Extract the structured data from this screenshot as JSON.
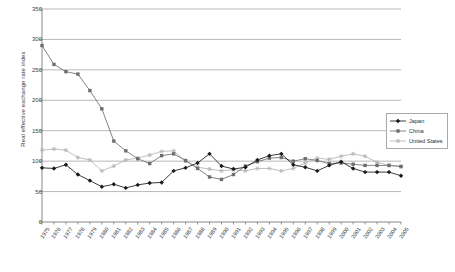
{
  "chart_data": {
    "type": "line",
    "title": "",
    "xlabel": "",
    "ylabel": "Real effective exchange rate index",
    "ylim": [
      0,
      350
    ],
    "yticks": [
      0,
      50,
      100,
      150,
      200,
      250,
      300,
      350
    ],
    "grid": "horizontal",
    "legend_position": "right",
    "categories": [
      "1975",
      "1976",
      "1977",
      "1978",
      "1979",
      "1980",
      "1981",
      "1982",
      "1983",
      "1984",
      "1985",
      "1986",
      "1987",
      "1988",
      "1989",
      "1990",
      "1991",
      "1992",
      "1993",
      "1994",
      "1995",
      "1996",
      "1997",
      "1998",
      "1999",
      "2000",
      "2001",
      "2002",
      "2003",
      "2004",
      "2005"
    ],
    "series": [
      {
        "name": "Japan",
        "color": "#1a1a1a",
        "marker": "diamond",
        "values": [
          89,
          88,
          94,
          78,
          68,
          58,
          62,
          56,
          61,
          64,
          65,
          84,
          89,
          97,
          112,
          92,
          87,
          90,
          102,
          109,
          112,
          94,
          90,
          84,
          93,
          99,
          88,
          82,
          82,
          82,
          76
        ]
      },
      {
        "name": "China",
        "color": "#6e6e6e",
        "marker": "square",
        "values": [
          290,
          259,
          247,
          243,
          216,
          186,
          133,
          117,
          104,
          96,
          109,
          112,
          101,
          88,
          74,
          70,
          78,
          92,
          99,
          105,
          106,
          100,
          104,
          101,
          96,
          97,
          95,
          93,
          93,
          93,
          91
        ]
      },
      {
        "name": "United States",
        "color": "#b5b5b5",
        "marker": "star",
        "values": [
          118,
          120,
          118,
          106,
          102,
          84,
          92,
          102,
          105,
          110,
          116,
          117,
          100,
          90,
          87,
          84,
          86,
          84,
          88,
          88,
          84,
          88,
          97,
          105,
          103,
          108,
          112,
          108,
          98,
          93,
          92
        ]
      }
    ]
  },
  "legend": {
    "items": [
      {
        "label": "Japan"
      },
      {
        "label": "China"
      },
      {
        "label": "United States"
      }
    ]
  }
}
